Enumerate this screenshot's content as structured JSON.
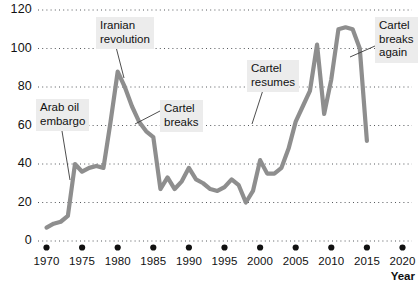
{
  "chart_data": {
    "type": "line",
    "title": "",
    "xlabel": "Year",
    "ylabel": "",
    "xlim": [
      1968,
      2021
    ],
    "ylim": [
      0,
      120
    ],
    "grid": "horizontal-dotted",
    "legend": "none",
    "line_color": "#8e8e8e",
    "x_ticks": [
      "1970",
      "1975",
      "1980",
      "1985",
      "1990",
      "1995",
      "2000",
      "2005",
      "2010",
      "2015",
      "2020"
    ],
    "y_ticks": [
      "0",
      "20",
      "40",
      "60",
      "80",
      "100",
      "120"
    ],
    "series": [
      {
        "name": "Crude oil price",
        "points": [
          [
            1970,
            7
          ],
          [
            1971,
            9
          ],
          [
            1972,
            10
          ],
          [
            1973,
            13
          ],
          [
            1974,
            40
          ],
          [
            1975,
            36
          ],
          [
            1976,
            38
          ],
          [
            1977,
            39
          ],
          [
            1978,
            38
          ],
          [
            1979,
            62
          ],
          [
            1980,
            88
          ],
          [
            1981,
            80
          ],
          [
            1982,
            70
          ],
          [
            1983,
            62
          ],
          [
            1984,
            57
          ],
          [
            1985,
            54
          ],
          [
            1986,
            27
          ],
          [
            1987,
            33
          ],
          [
            1988,
            27
          ],
          [
            1989,
            31
          ],
          [
            1990,
            38
          ],
          [
            1991,
            32
          ],
          [
            1992,
            30
          ],
          [
            1993,
            27
          ],
          [
            1994,
            26
          ],
          [
            1995,
            28
          ],
          [
            1996,
            32
          ],
          [
            1997,
            29
          ],
          [
            1998,
            20
          ],
          [
            1999,
            26
          ],
          [
            2000,
            42
          ],
          [
            2001,
            35
          ],
          [
            2002,
            35
          ],
          [
            2003,
            38
          ],
          [
            2004,
            48
          ],
          [
            2005,
            62
          ],
          [
            2006,
            70
          ],
          [
            2007,
            78
          ],
          [
            2008,
            102
          ],
          [
            2009,
            66
          ],
          [
            2010,
            84
          ],
          [
            2011,
            110
          ],
          [
            2012,
            111
          ],
          [
            2013,
            110
          ],
          [
            2014,
            100
          ],
          [
            2015,
            52
          ]
        ]
      }
    ],
    "annotations": [
      {
        "id": "arab-oil-embargo",
        "lines": [
          "Arab oil",
          "embargo"
        ],
        "box_x": 36,
        "box_y": 99,
        "leader_from": [
          62,
          131
        ],
        "leader_to": [
          70,
          180
        ]
      },
      {
        "id": "iranian-revolution",
        "lines": [
          "Iranian",
          "revolution"
        ],
        "box_x": 96,
        "box_y": 17,
        "leader_from": [
          116,
          47
        ],
        "leader_to": [
          124,
          78
        ]
      },
      {
        "id": "cartel-breaks",
        "lines": [
          "Cartel",
          "breaks"
        ],
        "box_x": 160,
        "box_y": 100,
        "leader_from": [
          160,
          111
        ],
        "leader_to": [
          135,
          124
        ]
      },
      {
        "id": "cartel-resumes",
        "lines": [
          "Cartel",
          "resumes"
        ],
        "box_x": 247,
        "box_y": 60,
        "leader_from": [
          263,
          90
        ],
        "leader_to": [
          252,
          124
        ]
      },
      {
        "id": "cartel-breaks-again",
        "lines": [
          "Cartel",
          "breaks",
          "again"
        ],
        "box_x": 375,
        "box_y": 17,
        "leader_from": [
          375,
          46
        ],
        "leader_to": [
          350,
          57
        ]
      }
    ]
  }
}
